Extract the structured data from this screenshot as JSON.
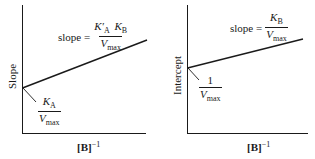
{
  "panels": [
    {
      "id": "left",
      "y_axis_label": "Slope",
      "x_axis_label_base": "[B]",
      "x_axis_label_exp": "−1",
      "slope_label_prefix": "slope =",
      "slope_numerator_K1": "K′",
      "slope_numerator_K1_sub": "A",
      "slope_numerator_K2": "K",
      "slope_numerator_K2_sub": "B",
      "slope_denominator": "V",
      "slope_denominator_sub": "max",
      "intercept_numerator": "K",
      "intercept_numerator_sub": "A",
      "intercept_denominator": "V",
      "intercept_denominator_sub": "max"
    },
    {
      "id": "right",
      "y_axis_label": "Intercept",
      "x_axis_label_base": "[B]",
      "x_axis_label_exp": "−1",
      "slope_label_prefix": "slope =",
      "slope_numerator": "K",
      "slope_numerator_sub": "B",
      "slope_denominator": "V",
      "slope_denominator_sub": "max",
      "intercept_numerator": "1",
      "intercept_denominator": "V",
      "intercept_denominator_sub": "max"
    }
  ],
  "colors": {
    "ink": "#1a1a1a",
    "background": "#ffffff"
  }
}
